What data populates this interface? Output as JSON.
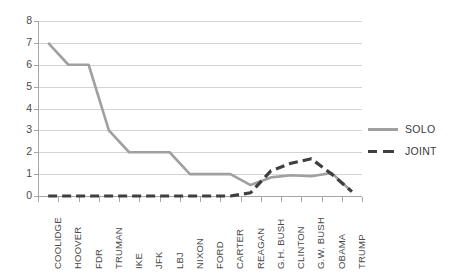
{
  "chart_data": {
    "type": "line",
    "title": "",
    "xlabel": "",
    "ylabel": "",
    "ylim": [
      0,
      8
    ],
    "y_ticks": [
      0,
      1,
      2,
      3,
      4,
      5,
      6,
      7,
      8
    ],
    "grid": true,
    "legend_position": "right",
    "categories": [
      "COOLIDGE",
      "HOOVER",
      "FDR",
      "TRUMAN",
      "IKE",
      "JFK",
      "LBJ",
      "NIXON",
      "FORD",
      "CARTER",
      "REAGAN",
      "G.H. BUSH",
      "CLINTON",
      "G.W. BUSH",
      "OBAMA",
      "TRUMP"
    ],
    "series": [
      {
        "name": "SOLO",
        "color": "#a0a0a0",
        "style": "solid",
        "values": [
          7,
          6,
          6,
          3,
          2,
          2,
          2,
          1,
          1,
          1,
          0.5,
          0.85,
          0.95,
          0.9,
          1.05,
          0.2
        ]
      },
      {
        "name": "JOINT",
        "color": "#3f3f3f",
        "style": "dashed",
        "values": [
          0,
          0,
          0,
          0,
          0,
          0,
          0,
          0,
          0,
          0,
          0.15,
          1.15,
          1.5,
          1.7,
          1.0,
          0.2
        ]
      }
    ]
  },
  "axis": {
    "y_tick_labels": [
      "0",
      "1",
      "2",
      "3",
      "4",
      "5",
      "6",
      "7",
      "8"
    ]
  },
  "legend": {
    "entries": [
      {
        "label": "SOLO"
      },
      {
        "label": "JOINT"
      }
    ]
  }
}
